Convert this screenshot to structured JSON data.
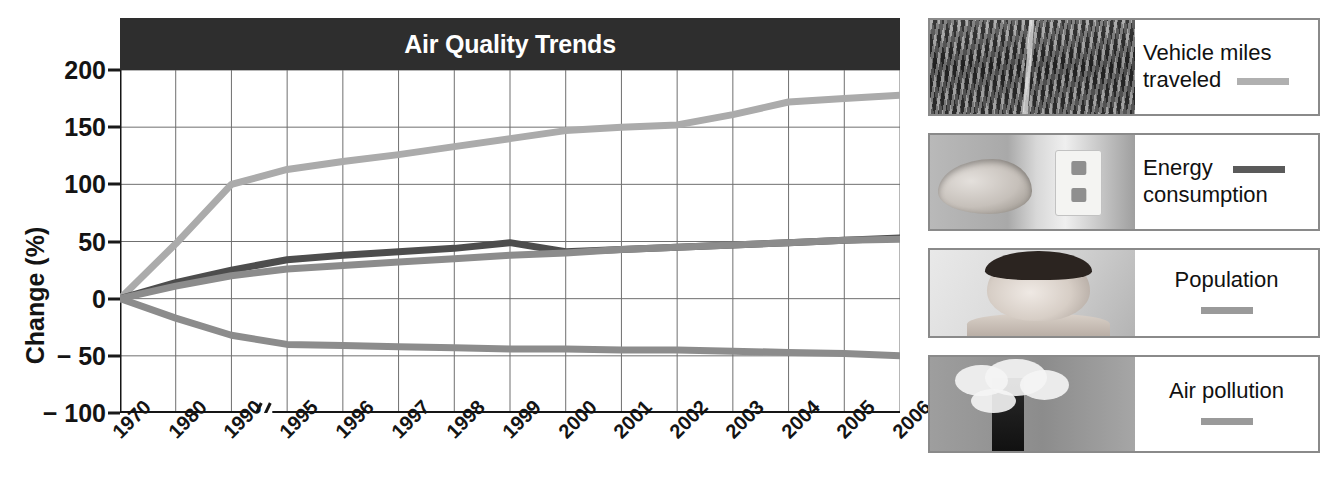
{
  "chart_data": {
    "type": "line",
    "title": "Air Quality Trends",
    "xlabel": "",
    "ylabel": "Change (%)",
    "ylim": [
      -100,
      200
    ],
    "yticks": [
      200,
      150,
      100,
      50,
      0,
      -50,
      -100
    ],
    "ytick_labels": [
      "200",
      "150",
      "100",
      "50",
      "0",
      "− 50",
      "− 100"
    ],
    "grid": true,
    "axis_break_between": [
      "1990",
      "1995"
    ],
    "legend_position": "right",
    "categories": [
      "1970",
      "1980",
      "1990",
      "1995",
      "1996",
      "1997",
      "1998",
      "1999",
      "2000",
      "2001",
      "2002",
      "2003",
      "2004",
      "2005",
      "2006"
    ],
    "series": [
      {
        "name": "Vehicle miles traveled",
        "color": "#ababab",
        "values": [
          0,
          48,
          100,
          113,
          120,
          126,
          133,
          140,
          147,
          150,
          152,
          161,
          172,
          175,
          178
        ]
      },
      {
        "name": "Energy consumption",
        "color": "#4d4d4d",
        "values": [
          0,
          14,
          25,
          34,
          38,
          41,
          44,
          49,
          41,
          43,
          45,
          47,
          49,
          51,
          53
        ]
      },
      {
        "name": "Population",
        "color": "#8c8c8c",
        "values": [
          0,
          11,
          20,
          26,
          29,
          32,
          35,
          38,
          40,
          43,
          45,
          47,
          49,
          51,
          52
        ]
      },
      {
        "name": "Air pollution",
        "color": "#8c8c8c",
        "values": [
          0,
          -17,
          -32,
          -40,
          -41,
          -42,
          -43,
          -44,
          -44,
          -45,
          -45,
          -46,
          -47,
          -48,
          -50
        ]
      }
    ]
  },
  "chart": {
    "title": "Air Quality Trends",
    "y_axis_title": "Change (%)"
  },
  "legend": {
    "items": [
      {
        "label_line1": "Vehicle miles",
        "label_line2": "traveled",
        "swatch_color": "#b0b0b0",
        "photo": "traffic-jam-photo",
        "layout": "swatch-after-line2"
      },
      {
        "label_line1": "Energy",
        "label_line2": "consumption",
        "swatch_color": "#5a5a5a",
        "photo": "hand-electrical-outlet-photo",
        "layout": "swatch-after-line1"
      },
      {
        "label_line1": "Population",
        "label_line2": "",
        "swatch_color": "#9a9a9a",
        "photo": "baby-photo",
        "layout": "swatch-below"
      },
      {
        "label_line1": "Air pollution",
        "label_line2": "",
        "swatch_color": "#9a9a9a",
        "photo": "smokestack-photo",
        "layout": "swatch-below"
      }
    ]
  }
}
